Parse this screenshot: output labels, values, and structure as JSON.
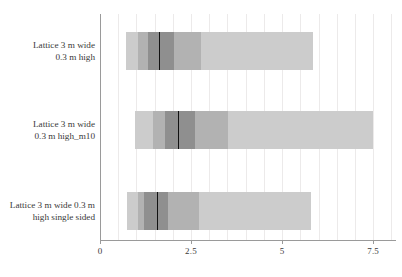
{
  "chart_data": {
    "type": "bar",
    "title": "",
    "xlabel": "",
    "ylabel": "",
    "orientation": "horizontal",
    "grid": true,
    "legend": "none",
    "xlim": [
      0,
      8.1
    ],
    "xticks": [
      0,
      2.5,
      5,
      7.5
    ],
    "xtick_labels": [
      "0",
      "2.5",
      "5",
      "7.5"
    ],
    "categories": [
      "Lattice 3 m wide\n0.3 m high",
      "Lattice 3 m wide\n0.3 m high_m10",
      "Lattice 3 m wide 0.3 m\nhigh single sided"
    ],
    "series": [
      {
        "name": "Lattice 3 m wide 0.3 m high",
        "outer_min": 0.72,
        "outer_max": 5.85,
        "mid_min": 1.05,
        "mid_max": 2.78,
        "inner_min": 1.33,
        "inner_max": 2.02,
        "median": 1.62
      },
      {
        "name": "Lattice 3 m wide 0.3 m high_m10",
        "outer_min": 0.97,
        "outer_max": 7.5,
        "mid_min": 1.45,
        "mid_max": 3.52,
        "inner_min": 1.78,
        "inner_max": 2.6,
        "median": 2.14
      },
      {
        "name": "Lattice 3 m wide 0.3 m high single sided",
        "outer_min": 0.73,
        "outer_max": 5.8,
        "mid_min": 1.03,
        "mid_max": 2.73,
        "inner_min": 1.21,
        "inner_max": 1.88,
        "median": 1.56
      }
    ],
    "colors": {
      "outer_band": "#cccccc",
      "mid_band": "#b2b2b2",
      "inner_band": "#8f8f8f",
      "median": "#111111",
      "gridline": "#eceaea",
      "axis": "#9a9a9a",
      "text": "#3a3a3a",
      "background": "#ffffff"
    }
  }
}
